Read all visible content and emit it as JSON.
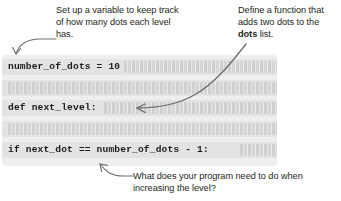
{
  "annotations": {
    "top_left": {
      "text": "Set up a variable to keep track of how many dots each level has.",
      "arrow": "curved-arrow-down-left"
    },
    "top_right": {
      "text_before": "Define a function that adds two dots to the ",
      "emphasis": "dots",
      "text_after": " list.",
      "arrow": "long-curved-arrow-down-left"
    },
    "bottom": {
      "text": "What does your program need to do when increasing the level?",
      "arrow": "curved-arrow-up-left"
    }
  },
  "code_panel": {
    "background_color": "#eeeeee",
    "row_color": "#e3e3e3",
    "lines": [
      {
        "id": "line-1",
        "visible": true,
        "text": "number_of_dots = 10"
      },
      {
        "id": "line-2",
        "visible": false,
        "text": ""
      },
      {
        "id": "line-3",
        "visible": true,
        "text": "def next_level:"
      },
      {
        "id": "line-4",
        "visible": false,
        "text": ""
      },
      {
        "id": "line-5",
        "visible": true,
        "text": "if next_dot == number_of_dots - 1:"
      }
    ]
  },
  "colors": {
    "text": "#231f20",
    "code_text": "#1b1b1b",
    "arrow": "#6d6e71",
    "panel": "#eeeeee",
    "row": "#e3e3e3",
    "page": "#ffffff"
  }
}
